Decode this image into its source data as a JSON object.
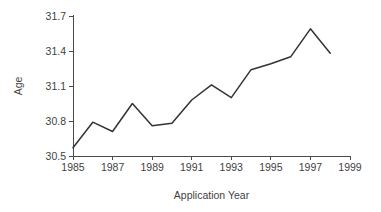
{
  "chart_data": {
    "type": "line",
    "title": "",
    "xlabel": "Application Year",
    "ylabel": "Age",
    "xlim": [
      1985,
      1999
    ],
    "ylim": [
      30.5,
      31.7
    ],
    "grid": false,
    "legend": null,
    "x_ticks": [
      "1985",
      "1987",
      "1989",
      "1991",
      "1993",
      "1995",
      "1997",
      "1999"
    ],
    "x_tick_values": [
      1985,
      1987,
      1989,
      1991,
      1993,
      1995,
      1997,
      1999
    ],
    "y_ticks": [
      "30.5",
      "30.8",
      "31.1",
      "31.4",
      "31.7"
    ],
    "y_tick_values": [
      30.5,
      30.8,
      31.1,
      31.4,
      31.7
    ],
    "x": [
      1985,
      1986,
      1987,
      1988,
      1989,
      1990,
      1991,
      1992,
      1993,
      1994,
      1995,
      1996,
      1997,
      1998
    ],
    "values": [
      30.57,
      30.79,
      30.71,
      30.95,
      30.76,
      30.78,
      30.98,
      31.11,
      31.0,
      31.24,
      31.29,
      31.35,
      31.59,
      31.38
    ],
    "series": [
      {
        "name": "Age",
        "values": [
          30.57,
          30.79,
          30.71,
          30.95,
          30.76,
          30.78,
          30.98,
          31.11,
          31.0,
          31.24,
          31.29,
          31.35,
          31.59,
          31.38
        ]
      }
    ],
    "colors": {
      "line": "#333333",
      "axis": "#4a4a4a",
      "text": "#3f3f3f",
      "background": "#ffffff"
    }
  },
  "plot_geometry": {
    "x_pixel_start": 73,
    "x_pixel_end": 350,
    "y_pixel_top": 16,
    "y_pixel_bottom": 156,
    "x_value_start": 1985,
    "x_value_end": 1999,
    "y_value_top": 31.7,
    "y_value_bottom": 30.5
  }
}
